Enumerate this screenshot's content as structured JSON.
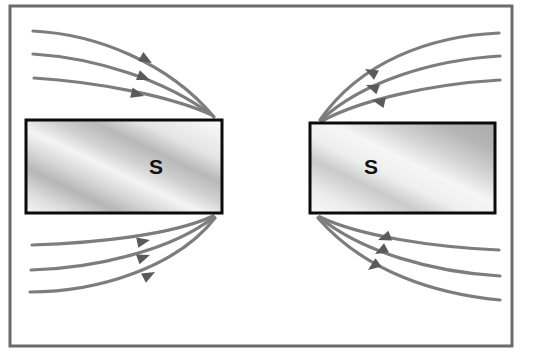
{
  "figure": {
    "background_color": "#ffffff",
    "frame": {
      "name": "outer-border-frame",
      "x": 10,
      "y": 6,
      "width": 502,
      "height": 340,
      "stroke_color": "#6b6b6b",
      "stroke_width": 3
    }
  },
  "magnets": [
    {
      "id": "left-magnet",
      "label": "S",
      "label_x": 156,
      "label_y": 168,
      "x": 26,
      "y": 120,
      "width": 196,
      "height": 93,
      "border_color": "#0b0b0b",
      "border_width": 3,
      "fill_light": "#f2f2f2",
      "fill_mid": "#d8d8d8",
      "fill_dark": "#b4b4b4"
    },
    {
      "id": "right-magnet",
      "label": "S",
      "label_x": 371,
      "label_y": 168,
      "x": 310,
      "y": 123,
      "width": 185,
      "height": 90,
      "border_color": "#0b0b0b",
      "border_width": 3,
      "fill_light": "#f4f4f4",
      "fill_mid": "#dcdcdc",
      "fill_dark": "#b0b0b0"
    }
  ],
  "field_lines": {
    "stroke_color": "#7d7d7d",
    "stroke_width": 3.2,
    "arrow_color": "#5a5a5a",
    "groups": [
      {
        "id": "upper-left-lines",
        "direction": "into-left-magnet-top-right-corner",
        "count": 3,
        "paths": [
          "M 33,31 C 95,34 168,62 214,117",
          "M 33,54 C 96,58 166,80 213,116",
          "M 34,78 C 98,82 170,96 212,115"
        ],
        "arrows": [
          {
            "x": 152,
            "y": 63,
            "angle": 30
          },
          {
            "x": 150,
            "y": 80,
            "angle": 22
          },
          {
            "x": 144,
            "y": 96,
            "angle": 15
          }
        ]
      },
      {
        "id": "lower-left-lines",
        "direction": "out-of-left-magnet-bottom-right-corner",
        "count": 3,
        "paths": [
          "M 32,245 C 96,243 172,235 213,216",
          "M 31,270 C 96,268 172,250 214,217",
          "M 30,292 C 96,292 176,268 215,218"
        ],
        "arrows": [
          {
            "x": 150,
            "y": 240,
            "angle": -12
          },
          {
            "x": 150,
            "y": 255,
            "angle": -20
          },
          {
            "x": 155,
            "y": 272,
            "angle": -28
          }
        ]
      },
      {
        "id": "upper-right-lines",
        "direction": "into-right-magnet-top-left-corner",
        "count": 3,
        "paths": [
          "M 499,33 C 430,36 360,62 320,120",
          "M 500,56 C 432,60 362,82 321,120",
          "M 500,80 C 432,84 360,100 322,121"
        ],
        "arrows": [
          {
            "x": 365,
            "y": 69,
            "angle": 208
          },
          {
            "x": 366,
            "y": 85,
            "angle": 200
          },
          {
            "x": 372,
            "y": 100,
            "angle": 193
          }
        ]
      },
      {
        "id": "lower-right-lines",
        "direction": "out-of-right-magnet-bottom-left-corner",
        "count": 3,
        "paths": [
          "M 320,217 C 360,236 432,247 499,250",
          "M 319,217 C 362,252 432,272 500,276",
          "M 318,218 C 365,272 436,294 500,300"
        ],
        "arrows": [
          {
            "x": 378,
            "y": 240,
            "angle": 160
          },
          {
            "x": 375,
            "y": 254,
            "angle": 152
          },
          {
            "x": 368,
            "y": 270,
            "angle": 144
          }
        ]
      }
    ]
  }
}
